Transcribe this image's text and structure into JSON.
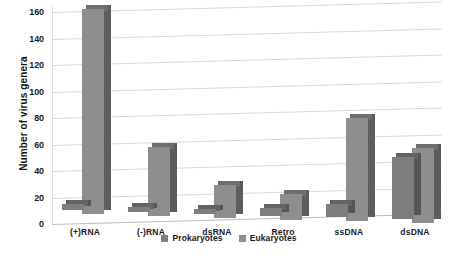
{
  "chart_data": {
    "type": "bar",
    "title": "",
    "xlabel": "",
    "ylabel": "Number of virus genera",
    "ylim": [
      0,
      160
    ],
    "ytick_step": 20,
    "yticks": [
      0,
      20,
      40,
      60,
      80,
      100,
      120,
      140,
      160
    ],
    "grid": true,
    "legend_position": "bottom-center",
    "categories": [
      "(+)RNA",
      "(-)RNA",
      "dsRNA",
      "Retro",
      "ssDNA",
      "dsDNA"
    ],
    "series": [
      {
        "name": "Prokaryotes",
        "color": "#7d7d7d",
        "values": [
          5,
          4,
          4,
          6,
          10,
          47
        ]
      },
      {
        "name": "Eukaryotes",
        "color": "#8e8e8e",
        "values": [
          155,
          52,
          25,
          19,
          78,
          57
        ]
      }
    ]
  },
  "legend": {
    "items": [
      {
        "label": "Prokaryotes",
        "color": "#7d7d7d"
      },
      {
        "label": "Eukaryotes",
        "color": "#8e8e8e"
      }
    ]
  },
  "axis": {
    "y_title": "Number of virus genera"
  }
}
